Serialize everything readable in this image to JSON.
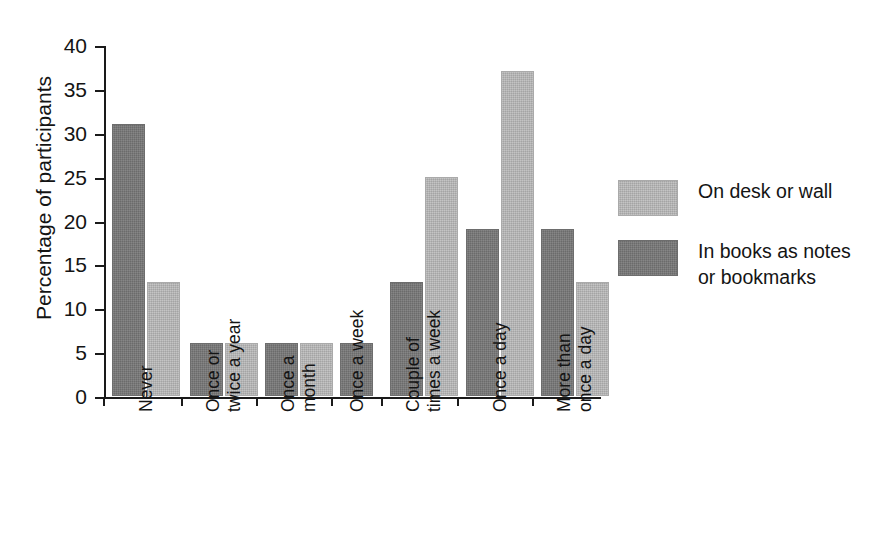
{
  "chart_data": {
    "type": "bar",
    "title": "",
    "xlabel": "",
    "ylabel": "Percentage of participants",
    "ylim": [
      0,
      40
    ],
    "yticks": [
      0,
      5,
      10,
      15,
      20,
      25,
      30,
      35,
      40
    ],
    "ytick_labels": [
      "0",
      "5",
      "10",
      "15",
      "20",
      "25",
      "30",
      "35",
      "40"
    ],
    "grid": false,
    "legend_position": "right",
    "categories": [
      "Never",
      "Once or twice a year",
      "Once a month",
      "Once a week",
      "Couple of times a week",
      "Once a day",
      "More than once a day"
    ],
    "category_lines": [
      [
        "Never"
      ],
      [
        "Once or",
        "twice a year"
      ],
      [
        "Once a",
        "month"
      ],
      [
        "Once a week"
      ],
      [
        "Couple of",
        "times a week"
      ],
      [
        "Once a day"
      ],
      [
        "More than",
        "once a day"
      ]
    ],
    "series": [
      {
        "name": "In books as notes or bookmarks",
        "key": "dark",
        "color": "#787878",
        "values": [
          31,
          6,
          6,
          6,
          13,
          19,
          19
        ]
      },
      {
        "name": "On desk or wall",
        "key": "light",
        "color": "#b6b6b6",
        "values": [
          13,
          6,
          6,
          null,
          25,
          37,
          13
        ]
      }
    ],
    "series_order_in_plot": [
      "dark",
      "light"
    ]
  },
  "legend": {
    "entries": [
      {
        "label": "On desk or wall",
        "swatch": "light"
      },
      {
        "label": "In books as notes or bookmarks",
        "swatch": "dark"
      }
    ],
    "entry_lines": [
      [
        "On desk or wall"
      ],
      [
        "In books as notes",
        "or bookmarks"
      ]
    ]
  },
  "colors": {
    "bar_dark": "#787878",
    "bar_light": "#b6b6b6",
    "axis": "#1a1a1a",
    "text": "#141414",
    "background": "#ffffff"
  }
}
